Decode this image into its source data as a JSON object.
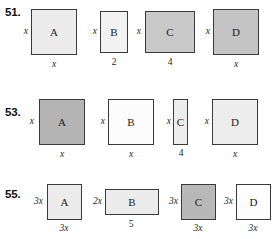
{
  "page": {
    "background": "#ffffff",
    "border_color": "#3a3a3a"
  },
  "fills": {
    "white": "#fdfdfd",
    "light": "#ececec",
    "medium": "#c9c9c9",
    "dark": "#b0b0b0"
  },
  "rows": [
    {
      "number": "51.",
      "figures": [
        {
          "letter": "A",
          "side_label": "x",
          "side_label_italic": true,
          "bottom_label": "x",
          "bottom_label_italic": true,
          "fill": "#ececec"
        },
        {
          "letter": "B",
          "side_label": "x",
          "side_label_italic": true,
          "bottom_label": "2",
          "bottom_label_italic": false,
          "fill": "#f2f2f2"
        },
        {
          "letter": "C",
          "side_label": "x",
          "side_label_italic": true,
          "bottom_label": "4",
          "bottom_label_italic": false,
          "fill": "#c9c9c9"
        },
        {
          "letter": "D",
          "side_label": "x",
          "side_label_italic": true,
          "bottom_label": "x",
          "bottom_label_italic": true,
          "fill": "#c4c4c4"
        }
      ]
    },
    {
      "number": "53.",
      "figures": [
        {
          "letter": "A",
          "side_label": "x",
          "side_label_italic": true,
          "bottom_label": "x",
          "bottom_label_italic": true,
          "fill": "#b4b4b4"
        },
        {
          "letter": "B",
          "side_label": "x",
          "side_label_italic": true,
          "bottom_label": "x",
          "bottom_label_italic": true,
          "fill": "#fcfcfc"
        },
        {
          "letter": "C",
          "side_label": "x",
          "side_label_italic": true,
          "bottom_label": "4",
          "bottom_label_italic": false,
          "fill": "#ededed"
        },
        {
          "letter": "D",
          "side_label": "x",
          "side_label_italic": true,
          "bottom_label": "x",
          "bottom_label_italic": true,
          "fill": "#ededed"
        }
      ]
    },
    {
      "number": "55.",
      "figures": [
        {
          "letter": "A",
          "side_label": "3x",
          "side_label_italic": true,
          "bottom_label": "3x",
          "bottom_label_italic": true,
          "fill": "#ececec"
        },
        {
          "letter": "B",
          "side_label": "2x",
          "side_label_italic": true,
          "bottom_label": "5",
          "bottom_label_italic": false,
          "fill": "#ececec"
        },
        {
          "letter": "C",
          "side_label": "3x",
          "side_label_italic": true,
          "bottom_label": "3x",
          "bottom_label_italic": true,
          "fill": "#b8b8b8"
        },
        {
          "letter": "D",
          "side_label": "3x",
          "side_label_italic": true,
          "bottom_label": "3x",
          "bottom_label_italic": true,
          "fill": "#fdfdfd"
        }
      ]
    }
  ]
}
